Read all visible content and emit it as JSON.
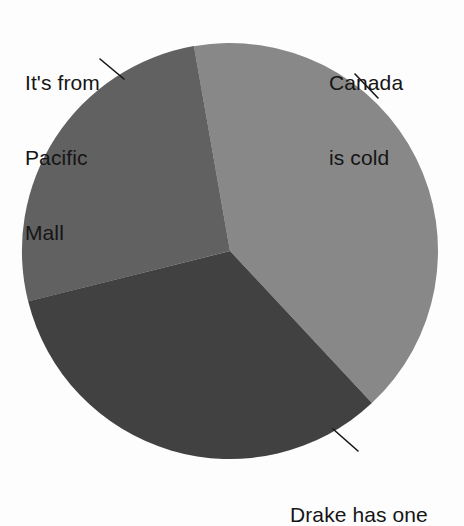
{
  "figure": {
    "background_color": "#fdfdfd",
    "text_color": "#151515"
  },
  "chart_data": {
    "type": "pie",
    "title": "",
    "subtitle": "",
    "xlabel": "",
    "ylabel": "",
    "grid": false,
    "legend_position": "none",
    "label_style": "leader-line callouts outside slices",
    "center": {
      "x": 230,
      "y": 251
    },
    "radius": 208,
    "start_angle_deg": 350,
    "direction": "clockwise",
    "categories": [
      "Canada is cold",
      "Drake has one",
      "It's from Pacific Mall"
    ],
    "values": [
      41,
      33,
      26
    ],
    "value_unit": "percent",
    "slices": [
      {
        "label": "Canada is cold",
        "value": 41,
        "angle_deg": 147,
        "start_deg": 350,
        "end_deg": 137,
        "color": "#8a8a8a"
      },
      {
        "label": "Drake has one",
        "value": 33,
        "angle_deg": 119,
        "start_deg": 137,
        "end_deg": 256,
        "color": "#3a3a3a"
      },
      {
        "label": "It's from Pacific Mall",
        "value": 26,
        "angle_deg": 94,
        "start_deg": 256,
        "end_deg": 350,
        "color": "#5e5e5e"
      }
    ],
    "annotations": [
      {
        "text": "Canada is cold",
        "position": "top-right"
      },
      {
        "text": "Drake has one",
        "position": "bottom-right"
      },
      {
        "text": "It's from Pacific Mall",
        "position": "top-left"
      }
    ]
  },
  "labels": {
    "pacific_mall_line1": "It's from",
    "pacific_mall_line2": "Pacific",
    "pacific_mall_line3": "Mall",
    "canada_line1": "Canada",
    "canada_line2": "is cold",
    "drake_line1": "Drake has one"
  }
}
